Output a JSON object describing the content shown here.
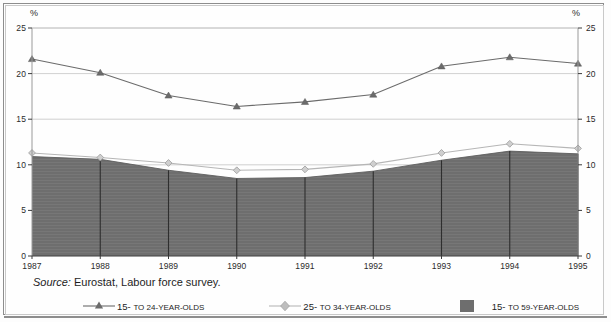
{
  "figure": {
    "source_prefix": "Source:",
    "source_text": " Eurostat, Labour force survey.",
    "unit_label_left": "%",
    "unit_label_right": "%"
  },
  "legend": {
    "position": "bottom",
    "items": [
      {
        "label_main": "15-",
        "label_small": "TO 24-YEAR-OLDS",
        "key": "triangle-line",
        "color": "#6b6b6b"
      },
      {
        "label_main": "25-",
        "label_small": "TO 34-YEAR-OLDS",
        "key": "diamond-line",
        "color": "#b6b6b6"
      },
      {
        "label_main": "15-",
        "label_small": "TO 59-YEAR-OLDS",
        "key": "filled-area",
        "color": "#6e6e6e"
      }
    ]
  },
  "chart_data": {
    "type": "line",
    "title": "",
    "subtitle": "",
    "xlabel": "",
    "ylabel": "%",
    "ylim": [
      0,
      25
    ],
    "yticks": [
      0,
      5,
      10,
      15,
      20,
      25
    ],
    "grid": true,
    "legend_position": "bottom",
    "categories": [
      "1987",
      "1988",
      "1989",
      "1990",
      "1991",
      "1992",
      "1993",
      "1994",
      "1995"
    ],
    "series": [
      {
        "name": "15- TO 24-YEAR-OLDS",
        "type": "line",
        "marker": "triangle",
        "color": "#6b6b6b",
        "values": [
          21.6,
          20.1,
          17.6,
          16.4,
          16.9,
          17.7,
          20.8,
          21.8,
          21.1
        ]
      },
      {
        "name": "25- TO 34-YEAR-OLDS",
        "type": "line",
        "marker": "diamond",
        "color": "#b6b6b6",
        "values": [
          11.3,
          10.8,
          10.2,
          9.4,
          9.5,
          10.1,
          11.3,
          12.3,
          11.8
        ]
      },
      {
        "name": "15- TO 59-YEAR-OLDS",
        "type": "area",
        "marker": "none",
        "color": "#6e6e6e",
        "values": [
          10.9,
          10.6,
          9.4,
          8.5,
          8.6,
          9.3,
          10.5,
          11.5,
          11.2
        ]
      }
    ]
  }
}
